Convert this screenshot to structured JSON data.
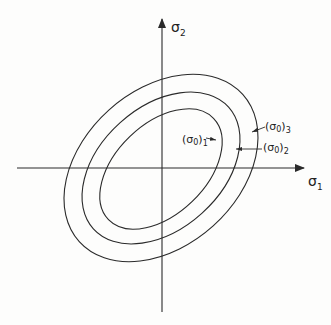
{
  "figure": {
    "axes": {
      "x_label": "σ",
      "x_sub": "1",
      "y_label": "σ",
      "y_sub": "2"
    },
    "curves": [
      {
        "label_main": "(σ",
        "label_sub0": "0",
        "label_close": ")",
        "label_sub": "1"
      },
      {
        "label_main": "(σ",
        "label_sub0": "0",
        "label_close": ")",
        "label_sub": "2"
      },
      {
        "label_main": "(σ",
        "label_sub0": "0",
        "label_close": ")",
        "label_sub": "3"
      }
    ],
    "colors": {
      "line": "#2a2a2a",
      "background": "#fdfdfc"
    }
  }
}
